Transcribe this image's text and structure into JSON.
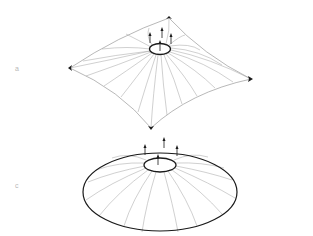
{
  "figure": {
    "type": "membrane-structure-diagram",
    "panels": [
      {
        "id": "a",
        "label": "a",
        "description": "Four-point tensile membrane (saddle) lifted at a central ring",
        "corners": {
          "top": [
            169,
            18
          ],
          "left": [
            70,
            68
          ],
          "right": [
            251,
            79
          ],
          "bottom": [
            151,
            128
          ]
        },
        "ring": {
          "cx": 160,
          "cy": 49,
          "rx": 10.5,
          "ry": 5.5
        },
        "arrows_up": 4
      },
      {
        "id": "c",
        "label": "c",
        "description": "Circular cone membrane lifted at a central ring",
        "outer_boundary": {
          "cx": 160,
          "cy": 192,
          "rx": 77,
          "ry": 39
        },
        "ring": {
          "cx": 160,
          "cy": 165,
          "rx": 16,
          "ry": 7
        },
        "arrows_up": 4
      }
    ],
    "colors": {
      "ring": "#1a1a1a",
      "boundary": "#1a1a1a",
      "fibers": "#a8a8a8",
      "label": "#b8b8b8"
    }
  }
}
